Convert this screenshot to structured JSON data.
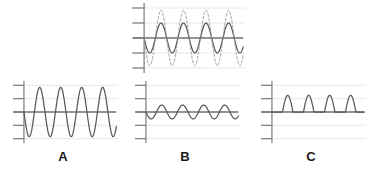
{
  "figure": {
    "title": "",
    "background_color": "#ffffff",
    "panel_count": 4
  },
  "style": {
    "curve_color": "#595959",
    "dashed_curve_color": "#9a9a9a",
    "gridline_color": "#e8e8e8",
    "axis_color": "#7a7a7a",
    "zero_line_color": "#707070",
    "label_color": "#1a1a1a"
  },
  "labels": {
    "a": "A",
    "b": "B",
    "c": "C"
  },
  "chart_data": [
    {
      "type": "line",
      "name": "reference-panel",
      "title": "",
      "xlabel": "",
      "ylabel": "",
      "xlim": [
        0,
        2.2
      ],
      "ylim": [
        -2.4,
        2.4
      ],
      "grid": true,
      "gridlines_y": [
        -2,
        -1,
        0,
        1,
        2
      ],
      "y_ticks": [
        -2,
        -1,
        0,
        1,
        2
      ],
      "legend": "none",
      "series": [
        {
          "name": "solid-sine",
          "style": "solid",
          "color": "#595959",
          "waveform": "sine",
          "amplitude": 1.0,
          "periods": 2,
          "phase": 3.141592653589793,
          "offset": 0
        },
        {
          "name": "dashed-sine-reference",
          "style": "dashed",
          "color": "#9a9a9a",
          "waveform": "sine",
          "amplitude": 1.85,
          "periods": 2,
          "phase": 3.141592653589793,
          "offset": 0
        }
      ]
    },
    {
      "type": "line",
      "name": "panel-a",
      "title": "A",
      "xlabel": "",
      "ylabel": "",
      "xlim": [
        0,
        2.2
      ],
      "ylim": [
        -2.4,
        2.4
      ],
      "grid": true,
      "gridlines_y": [
        -2,
        -1,
        0,
        1,
        2
      ],
      "y_ticks": [
        -2,
        -1,
        0,
        1,
        2
      ],
      "legend": "none",
      "series": [
        {
          "name": "large-amplitude-sine",
          "style": "solid",
          "color": "#595959",
          "waveform": "sine",
          "amplitude": 1.85,
          "periods": 2,
          "phase": 3.141592653589793,
          "offset": 0
        }
      ]
    },
    {
      "type": "line",
      "name": "panel-b",
      "title": "B",
      "xlabel": "",
      "ylabel": "",
      "xlim": [
        0,
        2.2
      ],
      "ylim": [
        -2.4,
        2.4
      ],
      "grid": true,
      "gridlines_y": [
        -2,
        -1,
        0,
        1,
        2
      ],
      "y_ticks": [
        -2,
        -1,
        0,
        1,
        2
      ],
      "legend": "none",
      "series": [
        {
          "name": "small-amplitude-sine",
          "style": "solid",
          "color": "#595959",
          "waveform": "sine",
          "amplitude": 0.52,
          "periods": 2,
          "phase": 3.141592653589793,
          "offset": 0
        }
      ]
    },
    {
      "type": "line",
      "name": "panel-c",
      "title": "C",
      "xlabel": "",
      "ylabel": "",
      "xlim": [
        0,
        2.2
      ],
      "ylim": [
        -2.4,
        2.4
      ],
      "grid": true,
      "gridlines_y": [
        -2,
        -1,
        0,
        1,
        2
      ],
      "y_ticks": [
        -2,
        -1,
        0,
        1,
        2
      ],
      "legend": "none",
      "series": [
        {
          "name": "half-wave-rectified-sine",
          "style": "solid",
          "color": "#595959",
          "waveform": "half-wave-rectified-sine",
          "amplitude": 1.25,
          "periods": 2,
          "phase": 3.141592653589793,
          "offset": 0
        }
      ]
    }
  ]
}
